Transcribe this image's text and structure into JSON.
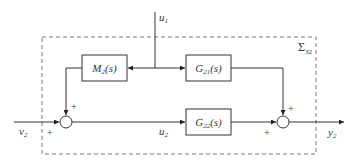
{
  "diagram": {
    "type": "block-diagram",
    "subsystem_label": "Σ",
    "subsystem_sub": "32",
    "blocks": [
      {
        "id": "M2",
        "name": "M",
        "sub": "2",
        "arg": "(s)"
      },
      {
        "id": "G21",
        "name": "G",
        "sub": "21",
        "arg": "(s)"
      },
      {
        "id": "G22",
        "name": "G",
        "sub": "22",
        "arg": "(s)"
      }
    ],
    "signals": {
      "u1": {
        "name": "u",
        "sub": "1"
      },
      "u2": {
        "name": "u",
        "sub": "2"
      },
      "v2": {
        "name": "v",
        "sub": "2"
      },
      "y2": {
        "name": "y",
        "sub": "2"
      }
    },
    "summing_junctions": [
      {
        "id": "sum-left",
        "signs": [
          "+",
          "+"
        ]
      },
      {
        "id": "sum-right",
        "signs": [
          "+",
          "+"
        ]
      }
    ],
    "colors": {
      "line": "#333333",
      "dashed_border": "#777777"
    }
  }
}
